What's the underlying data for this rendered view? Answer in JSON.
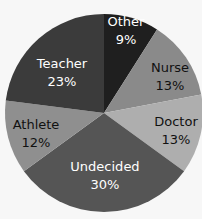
{
  "chart_data": {
    "type": "pie",
    "title": "",
    "start_angle_deg": 0,
    "direction": "clockwise",
    "center": [
      104,
      113
    ],
    "radius": 99,
    "slices": [
      {
        "label": "Other",
        "value": 9,
        "pct_text": "9%",
        "color": "#1f1f1f",
        "text_color": "#ffffff",
        "label_pos": [
          126,
          26
        ],
        "pct_pos": [
          126,
          44
        ]
      },
      {
        "label": "Nurse",
        "value": 13,
        "pct_text": "13%",
        "color": "#8a8a8a",
        "text_color": "#111111",
        "label_pos": [
          170,
          72
        ],
        "pct_pos": [
          170,
          90
        ]
      },
      {
        "label": "Doctor",
        "value": 13,
        "pct_text": "13%",
        "color": "#aeaeae",
        "text_color": "#111111",
        "label_pos": [
          176,
          126
        ],
        "pct_pos": [
          176,
          144
        ]
      },
      {
        "label": "Undecided",
        "value": 30,
        "pct_text": "30%",
        "color": "#555555",
        "text_color": "#ffffff",
        "label_pos": [
          105,
          171
        ],
        "pct_pos": [
          105,
          189
        ]
      },
      {
        "label": "Athlete",
        "value": 12,
        "pct_text": "12%",
        "color": "#8f8f8f",
        "text_color": "#111111",
        "label_pos": [
          36,
          129
        ],
        "pct_pos": [
          36,
          147
        ]
      },
      {
        "label": "Teacher",
        "value": 23,
        "pct_text": "23%",
        "color": "#3b3b3b",
        "text_color": "#ffffff",
        "label_pos": [
          62,
          68
        ],
        "pct_pos": [
          62,
          86
        ]
      }
    ]
  }
}
